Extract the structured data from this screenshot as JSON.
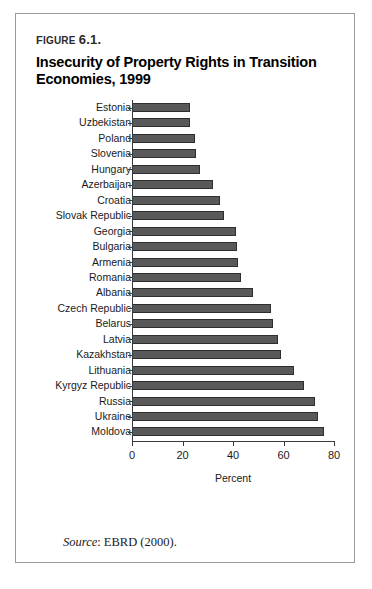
{
  "figure": {
    "number_prefix": "F",
    "number_rest": "IGURE",
    "number_label": "Figure 6.1.",
    "number_text": "6.1.",
    "title": "Insecurity of Property Rights in Transition Economies, 1999",
    "source_label": "Source",
    "source_text": ": EBRD (2000)."
  },
  "chart_data": {
    "type": "bar",
    "orientation": "horizontal",
    "title": "Insecurity of Property Rights in Transition Economies, 1999",
    "xlabel": "Percent",
    "ylabel": "",
    "xlim": [
      0,
      80
    ],
    "xticks": [
      0,
      20,
      40,
      60,
      80
    ],
    "xticklabels": [
      "0",
      "20",
      "40",
      "60",
      "80"
    ],
    "grid": false,
    "legend": false,
    "bar_color": "#595959",
    "bar_edge_color": "#2e2e2e",
    "categories": [
      "Estonia",
      "Uzbekistan",
      "Poland",
      "Slovenia",
      "Hungary",
      "Azerbaijan",
      "Croatia",
      "Slovak Republic",
      "Georgia",
      "Bulgaria",
      "Armenia",
      "Romania",
      "Albania",
      "Czech Republic",
      "Belarus",
      "Latvia",
      "Kazakhstan",
      "Lithuania",
      "Kyrgyz Republic",
      "Russia",
      "Ukraine",
      "Moldova"
    ],
    "values": [
      23,
      23,
      25,
      25.5,
      27,
      32,
      35,
      36.5,
      41,
      41.5,
      42,
      43,
      48,
      55,
      56,
      58,
      59,
      64,
      68,
      72.5,
      73.5,
      76
    ]
  }
}
